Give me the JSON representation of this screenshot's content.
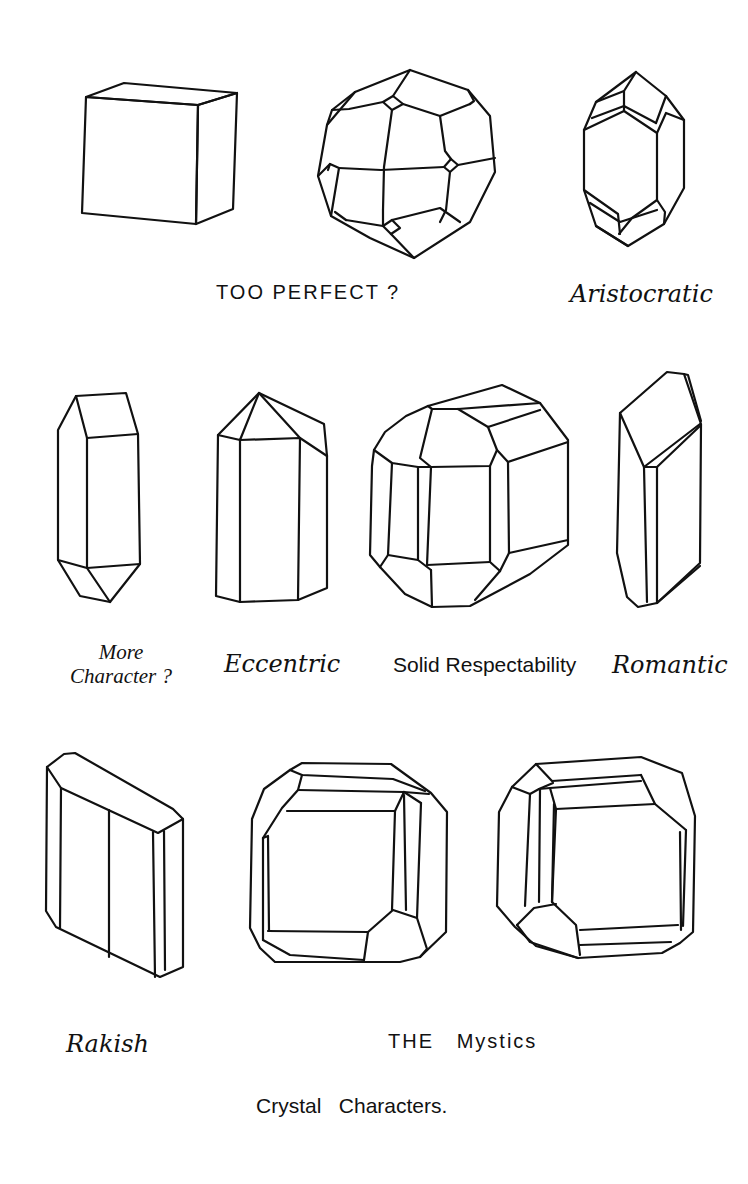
{
  "figure": {
    "title": "Crystal Characters.",
    "rows": [
      {
        "label": "TOO PERFECT ?",
        "crystals": [
          {
            "id": "cube",
            "caption": ""
          },
          {
            "id": "pentagonal-dodecahedron",
            "caption": ""
          },
          {
            "id": "prismatic-oval",
            "caption": "Aristocratic"
          }
        ]
      },
      {
        "label": "",
        "crystals": [
          {
            "id": "hexagonal-prism-pointed",
            "caption": "More Character ?"
          },
          {
            "id": "tall-prism-slanted-top",
            "caption": "Eccentric"
          },
          {
            "id": "blocky-barrel",
            "caption": "Solid Respectability"
          },
          {
            "id": "oblique-prism",
            "caption": "Romantic"
          }
        ]
      },
      {
        "label": "THE Mystics",
        "crystals": [
          {
            "id": "tabular-slab",
            "caption": "Rakish"
          },
          {
            "id": "square-beveled-left",
            "caption": ""
          },
          {
            "id": "square-beveled-right",
            "caption": ""
          }
        ]
      }
    ]
  },
  "labels": {
    "too_perfect": "TOO PERFECT ?",
    "aristocratic": "Aristocratic",
    "more": "More",
    "character": "Character ?",
    "eccentric": "Eccentric",
    "solid_respectability": "Solid Respectability",
    "romantic": "Romantic",
    "rakish": "Rakish",
    "the_mystics": "THE   Mystics",
    "title": "Crystal   Characters."
  },
  "colors": {
    "ink": "#111111",
    "paper": "#ffffff"
  }
}
